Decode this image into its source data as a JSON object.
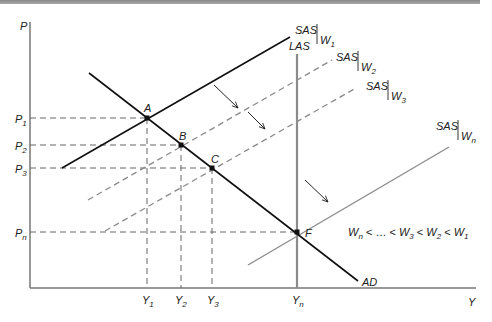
{
  "diagram": {
    "type": "AD-AS adjustment diagram",
    "axes": {
      "y_label": "P",
      "x_label": "Y"
    },
    "price_ticks": [
      {
        "label": "P",
        "sub": "1",
        "y": 118
      },
      {
        "label": "P",
        "sub": "2",
        "y": 145
      },
      {
        "label": "P",
        "sub": "3",
        "y": 168
      },
      {
        "label": "P",
        "sub": "n",
        "y": 232
      }
    ],
    "output_ticks": [
      {
        "label": "Y",
        "sub": "1",
        "x": 147
      },
      {
        "label": "Y",
        "sub": "2",
        "x": 181
      },
      {
        "label": "Y",
        "sub": "3",
        "x": 212
      },
      {
        "label": "Y",
        "sub": "n",
        "x": 297
      }
    ],
    "points": [
      {
        "label": "A",
        "x": 147,
        "y": 118
      },
      {
        "label": "B",
        "x": 181,
        "y": 145
      },
      {
        "label": "C",
        "x": 212,
        "y": 168
      },
      {
        "label": "F",
        "x": 297,
        "y": 232
      }
    ],
    "curves": {
      "ad": {
        "label": "AD"
      },
      "las": {
        "label": "LAS"
      },
      "sas_w1": {
        "label": "SAS",
        "wage": "W",
        "sub": "1"
      },
      "sas_w2": {
        "label": "SAS",
        "wage": "W",
        "sub": "2"
      },
      "sas_w3": {
        "label": "SAS",
        "wage": "W",
        "sub": "3"
      },
      "sas_wn": {
        "label": "SAS",
        "wage": "W",
        "sub": "n"
      }
    },
    "wage_ordering": {
      "parts": [
        "W",
        "n",
        " < … < ",
        "W",
        "3",
        " < ",
        "W",
        "2",
        " < ",
        "W",
        "1"
      ]
    },
    "colors": {
      "black": "#111111",
      "gray": "#8c8c8c",
      "dash": "#8a8a8a"
    }
  }
}
